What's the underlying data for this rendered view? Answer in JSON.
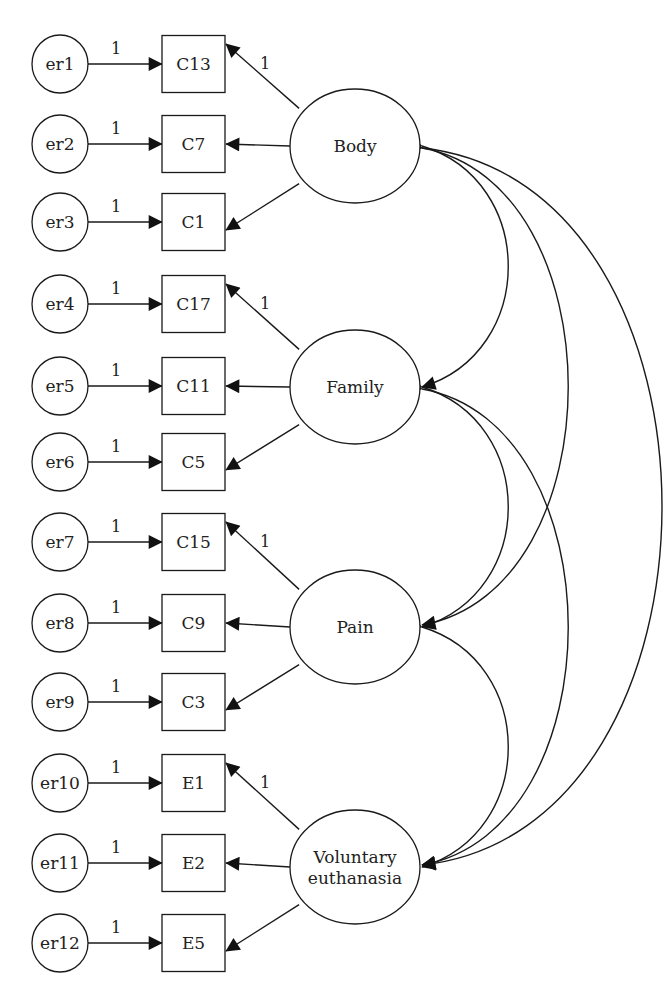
{
  "diagram": {
    "type": "structural-equation-model",
    "latent_factors": [
      {
        "id": "body",
        "label": [
          "Body"
        ],
        "indicators": [
          {
            "name": "C13",
            "error": "er1",
            "error_weight": "1",
            "loading": "1"
          },
          {
            "name": "C7",
            "error": "er2",
            "error_weight": "1",
            "loading": ""
          },
          {
            "name": "C1",
            "error": "er3",
            "error_weight": "1",
            "loading": ""
          }
        ]
      },
      {
        "id": "family",
        "label": [
          "Family"
        ],
        "indicators": [
          {
            "name": "C17",
            "error": "er4",
            "error_weight": "1",
            "loading": "1"
          },
          {
            "name": "C11",
            "error": "er5",
            "error_weight": "1",
            "loading": ""
          },
          {
            "name": "C5",
            "error": "er6",
            "error_weight": "1",
            "loading": ""
          }
        ]
      },
      {
        "id": "pain",
        "label": [
          "Pain"
        ],
        "indicators": [
          {
            "name": "C15",
            "error": "er7",
            "error_weight": "1",
            "loading": "1"
          },
          {
            "name": "C9",
            "error": "er8",
            "error_weight": "1",
            "loading": ""
          },
          {
            "name": "C3",
            "error": "er9",
            "error_weight": "1",
            "loading": ""
          }
        ]
      },
      {
        "id": "voluntary-euthanasia",
        "label": [
          "Voluntary",
          "euthanasia"
        ],
        "indicators": [
          {
            "name": "E1",
            "error": "er10",
            "error_weight": "1",
            "loading": "1"
          },
          {
            "name": "E2",
            "error": "er11",
            "error_weight": "1",
            "loading": ""
          },
          {
            "name": "E5",
            "error": "er12",
            "error_weight": "1",
            "loading": ""
          }
        ]
      }
    ],
    "covariances": [
      {
        "from": "body",
        "to": "family"
      },
      {
        "from": "body",
        "to": "pain"
      },
      {
        "from": "body",
        "to": "voluntary-euthanasia"
      },
      {
        "from": "family",
        "to": "pain"
      },
      {
        "from": "family",
        "to": "voluntary-euthanasia"
      },
      {
        "from": "pain",
        "to": "voluntary-euthanasia"
      }
    ]
  }
}
